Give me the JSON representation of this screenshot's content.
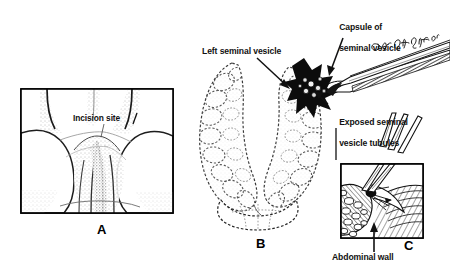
{
  "figure": {
    "background_color": "#ffffff",
    "ink_color": "#111111",
    "artist_signature": "Ges Rota Jr."
  },
  "panels": [
    {
      "id": "A",
      "letter": "A",
      "caption": "Perineal view showing incision site",
      "framed": true
    },
    {
      "id": "B",
      "letter": "B",
      "caption": "Paired seminal vesicles with capsule opened",
      "framed": false
    },
    {
      "id": "C",
      "letter": "C",
      "caption": "Detail of dissection through abdominal wall",
      "framed": true
    }
  ],
  "labels": {
    "incision_site": "Incision site",
    "left_seminal_vesicle": "Left seminal vesicle",
    "capsule_of_seminal_vesicle_line1": "Capsule of",
    "capsule_of_seminal_vesicle_line2": "seminal vesicle",
    "exposed_tubules_line1": "Exposed seminal",
    "exposed_tubules_line2": "vesicle tubules",
    "abdominal_wall": "Abdominal wall"
  },
  "icons": {
    "arrow_left_seminal_vesicle": "arrow-down-right-icon",
    "leader_capsule": "leader-line-icon",
    "leader_exposed_tubules": "leader-line-vertical-icon",
    "arrow_abdominal_wall": "arrow-up-icon",
    "forceps_instrument": "forceps-icon",
    "scissors_instrument": "scissors-icon",
    "signature": "signature-icon"
  }
}
